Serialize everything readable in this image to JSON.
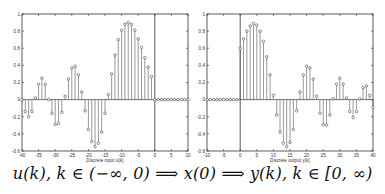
{
  "chart_data": [
    {
      "type": "stem",
      "title": "",
      "xlabel": "Discrete input u(k)",
      "ylabel": "",
      "xlim": [
        -40,
        10
      ],
      "ylim": [
        -0.6,
        1
      ],
      "xticks": [
        -40,
        -35,
        -30,
        -25,
        -20,
        -15,
        -10,
        -5,
        0,
        5,
        10
      ],
      "yticks": [
        -0.6,
        -0.4,
        -0.2,
        0,
        0.2,
        0.4,
        0.6,
        0.8,
        1
      ],
      "ytick_labels": [
        "-0.6",
        "-0.4",
        "-0.2",
        "0",
        "0.2",
        "0.4",
        "0.6",
        "0.8",
        "1"
      ],
      "vline_x": 0,
      "grid": false,
      "x": [
        -40,
        -39,
        -38,
        -37,
        -36,
        -35,
        -34,
        -33,
        -32,
        -31,
        -30,
        -29,
        -28,
        -27,
        -26,
        -25,
        -24,
        -23,
        -22,
        -21,
        -20,
        -19,
        -18,
        -17,
        -16,
        -15,
        -14,
        -13,
        -12,
        -11,
        -10,
        -9,
        -8,
        -7,
        -6,
        -5,
        -4,
        -3,
        -2,
        -1,
        0,
        1,
        2,
        3,
        4,
        5,
        6,
        7,
        8,
        9,
        10
      ],
      "values": [
        0.0,
        -0.14,
        -0.2,
        -0.14,
        0.02,
        0.18,
        0.25,
        0.18,
        0.0,
        -0.16,
        -0.29,
        -0.28,
        -0.15,
        0.04,
        0.24,
        0.37,
        0.39,
        0.29,
        0.09,
        -0.13,
        -0.35,
        -0.49,
        -0.55,
        -0.51,
        -0.38,
        -0.16,
        0.06,
        0.3,
        0.52,
        0.7,
        0.81,
        0.88,
        0.9,
        0.88,
        0.81,
        0.71,
        0.61,
        0.49,
        0.38,
        0.27,
        0,
        0,
        0,
        0,
        0,
        0,
        0,
        0,
        0,
        0,
        0
      ]
    },
    {
      "type": "stem",
      "title": "",
      "xlabel": "Discrete output y(k)",
      "ylabel": "",
      "xlim": [
        -10,
        40
      ],
      "ylim": [
        -0.6,
        1
      ],
      "xticks": [
        -10,
        -5,
        0,
        5,
        10,
        15,
        20,
        25,
        30,
        35,
        40
      ],
      "yticks": [
        -0.6,
        -0.4,
        -0.2,
        0,
        0.2,
        0.4,
        0.6,
        0.8,
        1
      ],
      "ytick_labels": [
        "-0.6",
        "-0.4",
        "-0.2",
        "0",
        "0.2",
        "0.4",
        "0.6",
        "0.8",
        "1"
      ],
      "vline_x": 0,
      "grid": false,
      "x": [
        -10,
        -9,
        -8,
        -7,
        -6,
        -5,
        -4,
        -3,
        -2,
        -1,
        0,
        1,
        2,
        3,
        4,
        5,
        6,
        7,
        8,
        9,
        10,
        11,
        12,
        13,
        14,
        15,
        16,
        17,
        18,
        19,
        20,
        21,
        22,
        23,
        24,
        25,
        26,
        27,
        28,
        29,
        30,
        31,
        32,
        33,
        34,
        35,
        36,
        37,
        38,
        39,
        40
      ],
      "values": [
        0,
        0,
        0,
        0,
        0,
        0,
        0,
        0,
        0,
        0,
        0.6,
        0.71,
        0.8,
        0.86,
        0.89,
        0.87,
        0.8,
        0.68,
        0.5,
        0.29,
        0.05,
        -0.18,
        -0.38,
        -0.51,
        -0.55,
        -0.5,
        -0.35,
        -0.13,
        0.09,
        0.29,
        0.39,
        0.37,
        0.24,
        0.04,
        -0.16,
        -0.29,
        -0.3,
        -0.18,
        0.01,
        0.18,
        0.25,
        0.18,
        0.02,
        -0.14,
        -0.21,
        -0.14,
        0.01,
        0.14,
        0.16,
        0.05,
        -0.09
      ]
    }
  ],
  "caption": "u(k), k ∈ (−∞, 0) ⟹ x(0) ⟹ y(k), k ∈ [0, ∞)",
  "style": {
    "line_color": "#333333",
    "stem_color": "#555555",
    "marker_color": "#444444"
  }
}
